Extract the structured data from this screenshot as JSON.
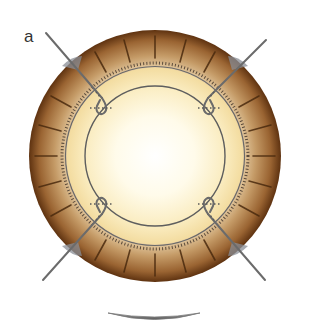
{
  "figure": {
    "panel_label": "a",
    "colors": {
      "rim_dark": "#6b3a14",
      "rim_mid": "#a8733e",
      "rim_light": "#d9b88c",
      "inner_band": "#f7e6b0",
      "center": "#ffffff",
      "line": "#6b6b6b",
      "wedge": "#8a8e96"
    },
    "geometry": {
      "center": [
        155,
        156
      ],
      "outer_radius": 126,
      "tick_ring_radius": 92,
      "inner_band_radius": 88,
      "inner_circle_radius": 70
    },
    "sutures": [
      {
        "position": "top-left",
        "start": [
          46,
          33
        ],
        "end": [
          106,
          102
        ]
      },
      {
        "position": "top-right",
        "start": [
          266,
          40
        ],
        "end": [
          204,
          102
        ]
      },
      {
        "position": "bottom-left",
        "start": [
          43,
          280
        ],
        "end": [
          106,
          210
        ]
      },
      {
        "position": "bottom-right",
        "start": [
          265,
          280
        ],
        "end": [
          204,
          210
        ]
      }
    ],
    "bottom_arc": {
      "description": "shallow lens-shaped side profile below the ring",
      "x_range": [
        108,
        200
      ],
      "y": 316
    }
  }
}
